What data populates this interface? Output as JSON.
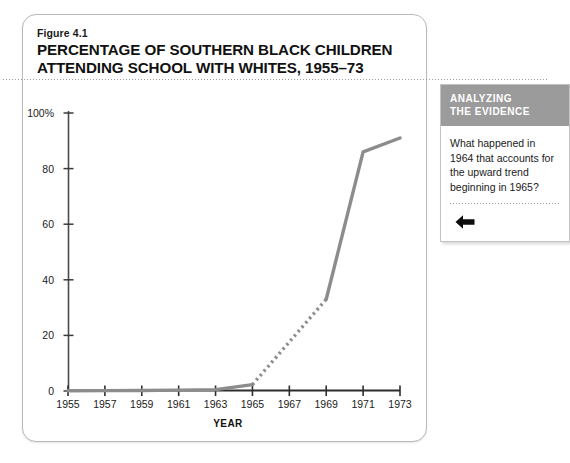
{
  "figure": {
    "label": "Figure 4.1",
    "title_line1": "PERCENTAGE OF SOUTHERN BLACK CHILDREN",
    "title_line2": "ATTENDING SCHOOL WITH WHITES, 1955–73"
  },
  "sidebar": {
    "header_line1": "ANALYZING",
    "header_line2": "THE EVIDENCE",
    "question": "What happened in 1964 that accounts for the upward trend beginning in 1965?",
    "back_arrow_icon": "left-arrow-icon"
  },
  "chart_data": {
    "type": "line",
    "title": "PERCENTAGE OF SOUTHERN BLACK CHILDREN ATTENDING SCHOOL WITH WHITES, 1955–73",
    "xlabel": "YEAR",
    "ylabel": "",
    "xlim": [
      1955,
      1973
    ],
    "ylim": [
      0,
      100
    ],
    "grid": false,
    "legend": false,
    "line_color": "#8c8c8c",
    "x_tick_labels": [
      "1955",
      "1957",
      "1959",
      "1961",
      "1963",
      "1965",
      "1967",
      "1969",
      "1971",
      "1973"
    ],
    "x_ticks": [
      1955,
      1957,
      1959,
      1961,
      1963,
      1965,
      1967,
      1969,
      1971,
      1973
    ],
    "y_tick_labels": [
      "0",
      "20",
      "40",
      "60",
      "80",
      "100%"
    ],
    "y_ticks": [
      0,
      20,
      40,
      60,
      80,
      100
    ],
    "series": [
      {
        "name": "Percentage of southern black children attending school with whites",
        "style": "solid",
        "x": [
          1955,
          1957,
          1959,
          1961,
          1963,
          1965
        ],
        "values": [
          0.1,
          0.15,
          0.2,
          0.3,
          0.5,
          2.3
        ]
      },
      {
        "name": "Percentage of southern black children attending school with whites (interpolated)",
        "style": "dotted",
        "x": [
          1965,
          1969
        ],
        "values": [
          2.3,
          33
        ]
      },
      {
        "name": "Percentage of southern black children attending school with whites (continued)",
        "style": "solid",
        "x": [
          1969,
          1971,
          1973
        ],
        "values": [
          33,
          86,
          91
        ]
      }
    ]
  }
}
